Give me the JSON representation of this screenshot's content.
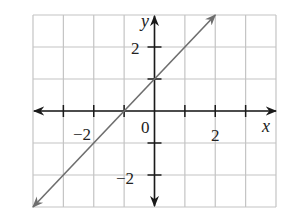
{
  "chart_data": {
    "type": "line",
    "title": "",
    "xlabel": "x",
    "ylabel": "y",
    "xlim": [
      -4,
      4
    ],
    "ylim": [
      -3,
      3
    ],
    "grid": true,
    "legend": null,
    "x_tick_labels": [
      {
        "value": -2,
        "text": "−2"
      },
      {
        "value": 2,
        "text": "2"
      }
    ],
    "y_tick_labels": [
      {
        "value": 2,
        "text": "2"
      },
      {
        "value": -2,
        "text": "−2"
      }
    ],
    "origin_label": "0",
    "x_ticks": [
      -3,
      -2,
      -1,
      1,
      2,
      3
    ],
    "y_ticks": [
      -2,
      -1,
      1,
      2
    ],
    "series": [
      {
        "name": "y = x + 1",
        "equation": "y = x + 1",
        "x": [
          -4,
          2
        ],
        "y": [
          -3,
          3
        ],
        "arrows": "both",
        "color": "#6e6e6e"
      }
    ]
  },
  "labels": {
    "x_axis": "x",
    "y_axis": "y",
    "origin": "0",
    "x_neg2": "−2",
    "x_pos2": "2",
    "y_pos2": "2",
    "y_neg2": "−2"
  },
  "colors": {
    "grid": "#c4c4c4",
    "axes": "#1a1a1a",
    "line": "#6e6e6e",
    "background": "#ffffff"
  }
}
